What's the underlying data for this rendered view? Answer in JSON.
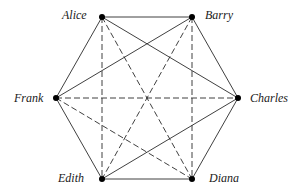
{
  "diagram": {
    "type": "complete-graph",
    "colors": {
      "line": "#2a2a2a",
      "node": "#000000",
      "background": "#ffffff"
    },
    "nodes": [
      {
        "id": "alice",
        "label": "Alice",
        "x": 102,
        "y": 17,
        "lx": 62,
        "ly": 9
      },
      {
        "id": "barry",
        "label": "Barry",
        "x": 192,
        "y": 17,
        "lx": 205,
        "ly": 9
      },
      {
        "id": "charles",
        "label": "Charles",
        "x": 238,
        "y": 98,
        "lx": 250,
        "ly": 92
      },
      {
        "id": "diana",
        "label": "Diana",
        "x": 192,
        "y": 179,
        "lx": 209,
        "ly": 172
      },
      {
        "id": "edith",
        "label": "Edith",
        "x": 102,
        "y": 179,
        "lx": 58,
        "ly": 172
      },
      {
        "id": "frank",
        "label": "Frank",
        "x": 56,
        "y": 98,
        "lx": 14,
        "ly": 92
      }
    ],
    "edges": [
      {
        "from": "alice",
        "to": "barry",
        "style": "solid"
      },
      {
        "from": "alice",
        "to": "frank",
        "style": "solid"
      },
      {
        "from": "alice",
        "to": "charles",
        "style": "solid"
      },
      {
        "from": "barry",
        "to": "frank",
        "style": "solid"
      },
      {
        "from": "barry",
        "to": "charles",
        "style": "solid"
      },
      {
        "from": "charles",
        "to": "diana",
        "style": "solid"
      },
      {
        "from": "charles",
        "to": "edith",
        "style": "solid"
      },
      {
        "from": "diana",
        "to": "edith",
        "style": "solid"
      },
      {
        "from": "edith",
        "to": "frank",
        "style": "solid"
      },
      {
        "from": "alice",
        "to": "edith",
        "style": "dashed"
      },
      {
        "from": "alice",
        "to": "diana",
        "style": "dashed"
      },
      {
        "from": "barry",
        "to": "diana",
        "style": "dashed"
      },
      {
        "from": "barry",
        "to": "edith",
        "style": "dashed"
      },
      {
        "from": "frank",
        "to": "charles",
        "style": "dashed"
      },
      {
        "from": "frank",
        "to": "diana",
        "style": "dashed"
      }
    ]
  }
}
